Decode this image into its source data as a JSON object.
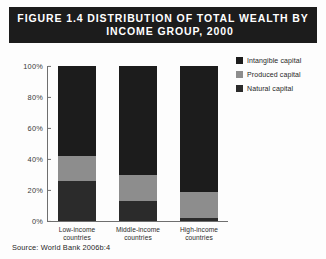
{
  "figure": {
    "title_line1": "FIGURE 1.4   DISTRIBUTION OF TOTAL WEALTH BY",
    "title_line2": "INCOME GROUP, 2000",
    "source": "Source: World Bank 2006b:4"
  },
  "legend": {
    "items": [
      {
        "label": "Intangible capital",
        "color": "#1c1c1c"
      },
      {
        "label": "Produced capital",
        "color": "#8d8d8d"
      },
      {
        "label": "Natural capital",
        "color": "#2b2b2b"
      }
    ]
  },
  "axis": {
    "ticks": [
      "100%",
      "80%",
      "60%",
      "40%",
      "20%",
      "0%"
    ]
  },
  "categories": [
    {
      "line1": "Low-income",
      "line2": "countries"
    },
    {
      "line1": "Middle-income",
      "line2": "countries"
    },
    {
      "line1": "High-income",
      "line2": "countries"
    }
  ],
  "chart_data": {
    "type": "bar",
    "subtype": "stacked-100-percent",
    "title": "FIGURE 1.4   DISTRIBUTION OF TOTAL WEALTH BY INCOME GROUP, 2000",
    "source": "Source: World Bank 2006b:4",
    "xlabel": "",
    "ylabel": "",
    "ylim": [
      0,
      100
    ],
    "yticks": [
      0,
      20,
      40,
      60,
      80,
      100
    ],
    "ytick_labels": [
      "0%",
      "20%",
      "40%",
      "60%",
      "80%",
      "100%"
    ],
    "grid": false,
    "legend_position": "right",
    "categories": [
      "Low-income countries",
      "Middle-income countries",
      "High-income countries"
    ],
    "series": [
      {
        "name": "Natural capital",
        "color": "#2b2b2b",
        "values": [
          26,
          13,
          2
        ]
      },
      {
        "name": "Produced capital",
        "color": "#8d8d8d",
        "values": [
          16,
          17,
          17
        ]
      },
      {
        "name": "Intangible capital",
        "color": "#1c1c1c",
        "values": [
          58,
          70,
          81
        ]
      }
    ],
    "stack_order_bottom_to_top": [
      "Natural capital",
      "Produced capital",
      "Intangible capital"
    ],
    "units": "percent of total wealth"
  }
}
